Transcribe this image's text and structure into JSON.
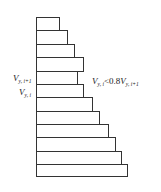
{
  "diagram": {
    "type": "story-shear-distribution",
    "stroke_color": "#333333",
    "background": "#ffffff",
    "frame": {
      "left_x": 36,
      "bottom_y": 176
    },
    "stories": [
      {
        "top": 17,
        "bottom": 30,
        "right": 59
      },
      {
        "top": 30,
        "bottom": 44,
        "right": 67
      },
      {
        "top": 44,
        "bottom": 57,
        "right": 74
      },
      {
        "top": 57,
        "bottom": 71,
        "right": 83
      },
      {
        "top": 71,
        "bottom": 84,
        "right": 77
      },
      {
        "top": 84,
        "bottom": 97,
        "right": 83
      },
      {
        "top": 97,
        "bottom": 111,
        "right": 92
      },
      {
        "top": 111,
        "bottom": 124,
        "right": 99
      },
      {
        "top": 124,
        "bottom": 137,
        "right": 108
      },
      {
        "top": 137,
        "bottom": 151,
        "right": 115
      },
      {
        "top": 151,
        "bottom": 164,
        "right": 121
      },
      {
        "top": 164,
        "bottom": 176,
        "right": 127
      }
    ]
  },
  "labels": {
    "upper_story": {
      "main": "V",
      "sub": "y, i+1"
    },
    "lower_story": {
      "main": "V",
      "sub": "y, i"
    },
    "condition": {
      "lhs_main": "V",
      "lhs_sub": "y, i",
      "operator": "<0.8",
      "rhs_main": "V",
      "rhs_sub": "y, i+1"
    }
  }
}
